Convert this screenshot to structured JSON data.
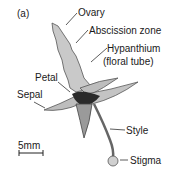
{
  "figure": {
    "panel_label": "(a)",
    "labels": {
      "ovary": "Ovary",
      "abscission_zone": "Abscission zone",
      "hypanthium_line1": "Hypanthium",
      "hypanthium_line2": "(floral tube)",
      "petal": "Petal",
      "sepal": "Sepal",
      "style": "Style",
      "stigma": "Stigma"
    },
    "scale_bar": {
      "label": "5mm"
    }
  }
}
